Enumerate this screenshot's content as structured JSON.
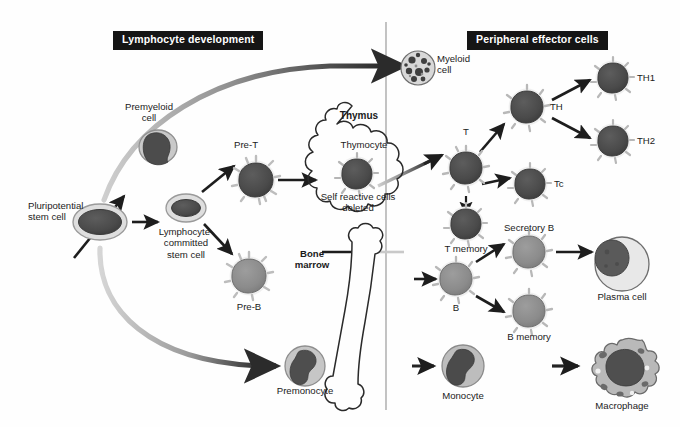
{
  "figure": {
    "width": 680,
    "height": 427,
    "background": "#fefefe",
    "divider_x": 386
  },
  "banners": [
    {
      "id": "lymphocyte-development",
      "label": "Lymphocyte development",
      "x": 113,
      "y": 31
    },
    {
      "id": "peripheral-effector-cells",
      "label": "Peripheral effector cells",
      "x": 467,
      "y": 31
    }
  ],
  "labels": {
    "pluripotential_stem_cell": "Pluripotential\nstem cell",
    "premyeloid_cell": "Premyeloid\ncell",
    "lymphocyte_committed_stem_cell": "Lymphocyte-\ncommitted\nstem cell",
    "pre_t": "Pre-T",
    "pre_b": "Pre-B",
    "premonocyte": "Premonocyte",
    "thymus": "Thymus",
    "thymocyte": "Thymocyte",
    "self_reactive": "Self reactive cells\ndeleted",
    "bone_marrow": "Bone\nmarrow",
    "myeloid_cell": "Myeloid\ncell",
    "t_cell": "T",
    "t_memory": "T memory",
    "th": "TH",
    "th1": "TH1",
    "th2": "TH2",
    "tc": "Tc",
    "b_cell": "B",
    "secretory_b": "Secretory B",
    "b_memory": "B memory",
    "plasma_cell": "Plasma cell",
    "monocyte": "Monocyte",
    "macrophage": "Macrophage"
  },
  "colors": {
    "banner_bg": "#151515",
    "banner_text": "#ffffff",
    "text": "#1b1b1b",
    "arrow_dark": "#1d1d1d",
    "arrow_gray": "#8c8c8c",
    "divider": "#9a9a9a",
    "nucleus_dark": "#4a4a4a",
    "nucleus_mid": "#8b8b8b",
    "cytoplasm_light": "#d2d2d2",
    "cytoplasm_pale": "#e6e6e6",
    "outline": "#4e4e4e"
  },
  "cells": [
    {
      "id": "pluripotential-stem-cell",
      "type": "stem-oval",
      "cx": 100,
      "cy": 222,
      "r": 26,
      "label_key": "pluripotential_stem_cell",
      "label_x": 28,
      "label_y": 200,
      "label_align": "lead"
    },
    {
      "id": "premyeloid-cell",
      "type": "premyeloid",
      "cx": 158,
      "cy": 146,
      "r": 18,
      "label_key": "premyeloid_cell",
      "label_x": 149,
      "label_y": 106,
      "label_align": "center"
    },
    {
      "id": "lymphocyte-committed-stem-cell",
      "type": "stem-oval-small",
      "cx": 186,
      "cy": 208,
      "r": 19,
      "label_key": "lymphocyte_committed_stem_cell",
      "label_x": 186,
      "label_y": 225,
      "label_align": "center"
    },
    {
      "id": "pre-t-cell",
      "type": "spiky-dark",
      "cx": 256,
      "cy": 180,
      "r": 19,
      "label_key": "pre_t",
      "label_x": 246,
      "label_y": 139,
      "label_align": "center"
    },
    {
      "id": "pre-b-cell",
      "type": "spiky-light",
      "cx": 249,
      "cy": 276,
      "r": 19,
      "label_key": "pre_b",
      "label_x": 249,
      "label_y": 301,
      "label_align": "center"
    },
    {
      "id": "premonocyte",
      "type": "monocyte",
      "cx": 305,
      "cy": 366,
      "r": 20,
      "label_key": "premonocyte",
      "label_x": 305,
      "label_y": 390,
      "label_align": "center"
    },
    {
      "id": "thymocyte-cell",
      "type": "spiky-dark",
      "cx": 357,
      "cy": 174,
      "r": 17,
      "label_key": null
    },
    {
      "id": "myeloid-cell",
      "type": "granular",
      "cx": 418,
      "cy": 68,
      "r": 17,
      "label_key": "myeloid_cell",
      "label_x": 458,
      "label_y": 56,
      "label_align": "center"
    },
    {
      "id": "t-cell",
      "type": "spiky-dark",
      "cx": 466,
      "cy": 168,
      "r": 18,
      "label_key": "t_cell",
      "label_x": 466,
      "label_y": 127,
      "label_align": "center"
    },
    {
      "id": "t-memory-cell",
      "type": "spiky-dark",
      "cx": 466,
      "cy": 224,
      "r": 17,
      "label_key": "t_memory",
      "label_x": 466,
      "label_y": 245,
      "label_align": "center"
    },
    {
      "id": "th-cell",
      "type": "spiky-dark",
      "cx": 527,
      "cy": 107,
      "r": 18,
      "label_key": "th",
      "label_x": 558,
      "label_y": 102,
      "label_align": "lead"
    },
    {
      "id": "th1-cell",
      "type": "spiky-dark",
      "cx": 613,
      "cy": 78,
      "r": 17,
      "label_key": "th1",
      "label_x": 640,
      "label_y": 73,
      "label_align": "lead"
    },
    {
      "id": "th2-cell",
      "type": "spiky-dark",
      "cx": 613,
      "cy": 141,
      "r": 17,
      "label_key": "th2",
      "label_x": 640,
      "label_y": 136,
      "label_align": "lead"
    },
    {
      "id": "tc-cell",
      "type": "spiky-dark",
      "cx": 530,
      "cy": 184,
      "r": 17,
      "label_key": "tc",
      "label_x": 559,
      "label_y": 180,
      "label_align": "lead"
    },
    {
      "id": "b-cell",
      "type": "spiky-light",
      "cx": 456,
      "cy": 279,
      "r": 18,
      "label_key": "b_cell",
      "label_x": 456,
      "label_y": 303,
      "label_align": "center"
    },
    {
      "id": "secretory-b-cell",
      "type": "spiky-light",
      "cx": 529,
      "cy": 252,
      "r": 18,
      "label_key": "secretory_b",
      "label_x": 529,
      "label_y": 228,
      "label_align": "center"
    },
    {
      "id": "b-memory-cell",
      "type": "spiky-light",
      "cx": 529,
      "cy": 311,
      "r": 18,
      "label_key": "b_memory",
      "label_x": 529,
      "label_y": 331,
      "label_align": "center"
    },
    {
      "id": "plasma-cell",
      "type": "plasma",
      "cx": 622,
      "cy": 264,
      "r": 26,
      "label_key": "plasma_cell",
      "label_x": 622,
      "label_y": 296,
      "label_align": "center"
    },
    {
      "id": "monocyte",
      "type": "monocyte",
      "cx": 463,
      "cy": 366,
      "r": 21,
      "label_key": "monocyte",
      "label_x": 463,
      "label_y": 391,
      "label_align": "center"
    },
    {
      "id": "macrophage",
      "type": "macrophage",
      "cx": 622,
      "cy": 371,
      "r": 30,
      "label_key": "macrophage",
      "label_x": 622,
      "label_y": 404,
      "label_align": "center"
    }
  ],
  "organs": [
    {
      "id": "thymus-cloud",
      "label_key": "thymus",
      "label_x": 359,
      "label_y": 115,
      "bold": true
    },
    {
      "id": "thymus-cloud",
      "label_key": "thymocyte",
      "label_x": 362,
      "label_y": 144,
      "bold": false
    },
    {
      "id": "thymus-cloud",
      "label_key": "self_reactive",
      "label_x": 358,
      "label_y": 196,
      "bold": false
    },
    {
      "id": "bone-marrow",
      "label_key": "bone_marrow",
      "label_x": 312,
      "label_y": 255,
      "bold": true
    }
  ]
}
